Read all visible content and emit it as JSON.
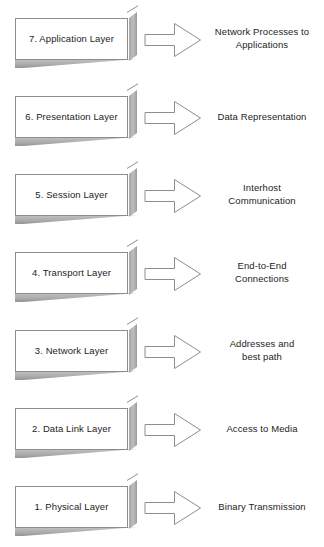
{
  "diagram": {
    "accent_color": "#8d8d8d",
    "box_fill": "#ffffff",
    "bevel_color": "#ababab",
    "text_color": "#1d1d1d",
    "arrow_icon": "right-arrow-outline-icon",
    "rows": [
      {
        "number": "7",
        "layer_label": "7. Application Layer",
        "description": "Network Processes to\nApplications"
      },
      {
        "number": "6",
        "layer_label": "6. Presentation Layer",
        "description": "Data Representation"
      },
      {
        "number": "5",
        "layer_label": "5. Session Layer",
        "description": "Interhost\nCommunication"
      },
      {
        "number": "4",
        "layer_label": "4. Transport Layer",
        "description": "End-to-End\nConnections"
      },
      {
        "number": "3",
        "layer_label": "3. Network Layer",
        "description": "Addresses and\nbest path"
      },
      {
        "number": "2",
        "layer_label": "2. Data Link Layer",
        "description": "Access to Media"
      },
      {
        "number": "1",
        "layer_label": "1. Physical Layer",
        "description": "Binary Transmission"
      }
    ]
  }
}
